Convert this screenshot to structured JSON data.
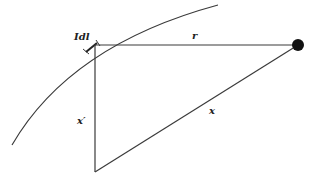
{
  "diagram": {
    "labels": {
      "current_element": "Idl",
      "r": "r",
      "x_prime": "x′",
      "x": "x"
    },
    "colors": {
      "stroke": "#3a3a3a",
      "point": "#111111",
      "background": "#ffffff"
    },
    "elements": {
      "wire_curve": "current-carrying wire (curved)",
      "field_point": "observation point"
    }
  }
}
